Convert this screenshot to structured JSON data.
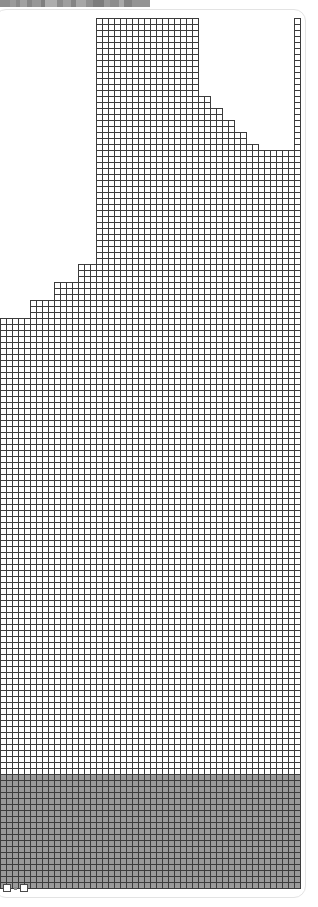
{
  "window": {
    "titlebar": {
      "name": "scaled-window-titlebar",
      "background": "#868686",
      "width_px": 150,
      "height_px": 7,
      "segments": [
        {
          "label": "",
          "color": "#8d8d8d",
          "width_px": 10
        },
        {
          "label": "",
          "color": "#9b9b9b",
          "width_px": 6
        },
        {
          "label": "",
          "color": "#8a8a8a",
          "width_px": 4
        },
        {
          "label": "",
          "color": "#a2a2a2",
          "width_px": 7
        },
        {
          "label": "",
          "color": "#878787",
          "width_px": 5
        },
        {
          "label": "",
          "color": "#989898",
          "width_px": 9
        },
        {
          "label": "",
          "color": "#7f7f7f",
          "width_px": 4
        },
        {
          "label": "",
          "color": "#adadad",
          "width_px": 12
        },
        {
          "label": "",
          "color": "#8b8b8b",
          "width_px": 6
        },
        {
          "label": "",
          "color": "#9e9e9e",
          "width_px": 8
        },
        {
          "label": "",
          "color": "#848484",
          "width_px": 5
        },
        {
          "label": "",
          "color": "#a6a6a6",
          "width_px": 10
        },
        {
          "label": "",
          "color": "#8f8f8f",
          "width_px": 7
        },
        {
          "label": "",
          "color": "#7d7d7d",
          "width_px": 11
        },
        {
          "label": "",
          "color": "#999999",
          "width_px": 6
        },
        {
          "label": "",
          "color": "#8c8c8c",
          "width_px": 9
        },
        {
          "label": "",
          "color": "#a9a9a9",
          "width_px": 5
        },
        {
          "label": "",
          "color": "#828282",
          "width_px": 8
        },
        {
          "label": "",
          "color": "#949494",
          "width_px": 18
        }
      ]
    },
    "panel": {
      "name": "content-panel",
      "background": "#ffffff",
      "border_color": "#e3e3e3",
      "border_radius_px": 12
    }
  },
  "chart_data": {
    "type": "heatmap",
    "title": "",
    "subtitle": "",
    "xlabel": "",
    "ylabel": "",
    "grid": true,
    "legend_position": "none",
    "cell_size_px": 6,
    "cell_border_color": "#3c3c3c",
    "cell_border_width_px": 1,
    "cell_empty_fill": "#ffffff",
    "cell_shaded_fill": "#9a9a9a",
    "columns": 50,
    "rows": 146,
    "x_origin_px": 0,
    "y_origin_px": 12,
    "shaded_row_start": 127,
    "column_labels": [
      "c0",
      "c1",
      "c2",
      "c3",
      "c4",
      "c5",
      "c6",
      "c7",
      "c8",
      "c9",
      "c10",
      "c11",
      "c12",
      "c13",
      "c14",
      "c15",
      "c16",
      "c17",
      "c18",
      "c19",
      "c20",
      "c21",
      "c22",
      "c23",
      "c24",
      "c25",
      "c26",
      "c27",
      "c28",
      "c29",
      "c30",
      "c31",
      "c32",
      "c33",
      "c34",
      "c35",
      "c36",
      "c37",
      "c38",
      "c39",
      "c40",
      "c41",
      "c42",
      "c43",
      "c44",
      "c45",
      "c46",
      "c47",
      "c48",
      "c49"
    ],
    "column_top_rows": [
      51,
      51,
      51,
      51,
      51,
      48,
      48,
      48,
      48,
      45,
      45,
      45,
      45,
      42,
      42,
      42,
      1,
      1,
      1,
      1,
      1,
      1,
      1,
      1,
      1,
      1,
      1,
      1,
      1,
      1,
      1,
      1,
      1,
      14,
      14,
      16,
      16,
      18,
      18,
      20,
      20,
      22,
      22,
      23,
      23,
      23,
      23,
      23,
      23,
      1
    ],
    "column_values": [
      95,
      95,
      95,
      95,
      95,
      98,
      98,
      98,
      98,
      101,
      101,
      101,
      101,
      104,
      104,
      104,
      145,
      145,
      145,
      145,
      145,
      145,
      145,
      145,
      145,
      145,
      145,
      145,
      145,
      145,
      145,
      145,
      145,
      132,
      132,
      130,
      130,
      128,
      128,
      126,
      126,
      124,
      124,
      123,
      123,
      123,
      123,
      123,
      123,
      145
    ],
    "ylim": [
      0,
      146
    ],
    "xlim": [
      0,
      50
    ]
  },
  "status_bar": {
    "name": "status-bar",
    "items": [
      {
        "name": "checkbox-icon-left",
        "type": "checkbox",
        "checked": false,
        "label": ""
      },
      {
        "name": "dot-indicator",
        "type": "dot",
        "label": ""
      },
      {
        "name": "checkbox-icon-right",
        "type": "checkbox",
        "checked": false,
        "label": ""
      }
    ]
  }
}
